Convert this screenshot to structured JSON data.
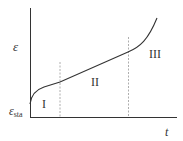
{
  "diagram": {
    "type": "creep-curve",
    "y_axis_label": "ε",
    "x_axis_label": "t",
    "origin_label_main": "ε",
    "origin_label_sub": "sta",
    "stages": [
      {
        "label": "I"
      },
      {
        "label": "II"
      },
      {
        "label": "III"
      }
    ],
    "colors": {
      "line": "#333333",
      "dashed": "#999999"
    }
  }
}
